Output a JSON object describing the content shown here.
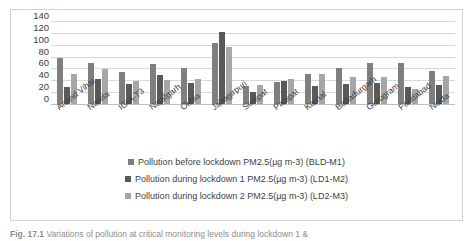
{
  "chart_data": {
    "type": "bar",
    "title": "",
    "xlabel": "",
    "ylabel": "",
    "ylim": [
      0,
      140
    ],
    "yticks": [
      140,
      120,
      100,
      80,
      60,
      40,
      20,
      0
    ],
    "grid": true,
    "legend_position": "bottom",
    "categories": [
      "Anand Vihar",
      "Narela",
      "IGIA-T3",
      "Najafgarh",
      "Okhla",
      "Jahagirpuri",
      "Sonipat",
      "Panipat",
      "Karnal",
      "Bahadurgarh",
      "Gurugram",
      "Faridabad",
      "Noida"
    ],
    "series": [
      {
        "name": "Pollution before lockdown PM2.5(µg m-3) (BLD-M1)",
        "color": "#7f7f7f",
        "values": [
          77,
          70,
          54,
          68,
          61,
          103,
          31,
          37,
          50,
          60,
          69,
          69,
          55
        ]
      },
      {
        "name": "Pollution during lockdown 1 PM2.5(µg m-3) (LD1-M2)",
        "color": "#595959",
        "values": [
          29,
          42,
          33,
          49,
          36,
          121,
          21,
          38,
          30,
          34,
          36,
          29,
          32
        ]
      },
      {
        "name": "Pollution during lockdown 2 PM2.5(µg m-3) (LD2-M3)",
        "color": "#a6a6a6",
        "values": [
          51,
          59,
          39,
          41,
          42,
          96,
          32,
          42,
          51,
          45,
          46,
          25,
          47
        ]
      }
    ]
  },
  "legend": {
    "items": [
      {
        "label": "Pollution before lockdown PM2.5(µg m-3) (BLD-M1)"
      },
      {
        "label": "Pollution during lockdown 1 PM2.5(µg m-3) (LD1-M2)"
      },
      {
        "label": "Pollution during lockdown 2 PM2.5(µg m-3) (LD2-M3)"
      }
    ]
  },
  "caption": {
    "figure_number": "Fig. 17.1",
    "text": "Variations of pollution at critical monitoring levels during lockdown 1 &"
  }
}
